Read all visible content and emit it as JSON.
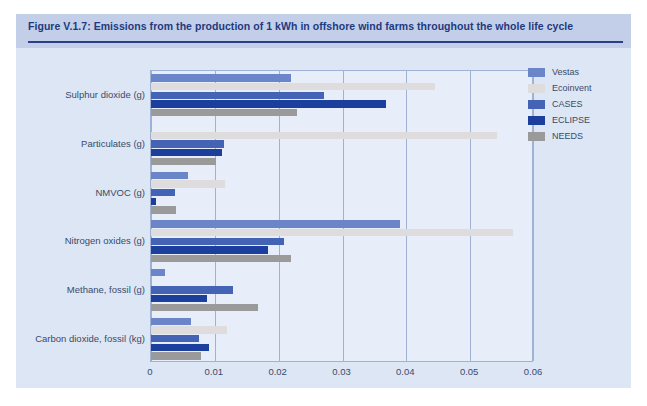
{
  "figure": {
    "title": "Figure V.1.7: Emissions from the production of 1 kWh in offshore wind farms throughout the whole life cycle",
    "title_band_color": "#c3cfe8",
    "title_text_color": "#22397f",
    "body_background": "#dde6f4",
    "plot_background": "#e7eef9",
    "grid_color": "#9fb2d4"
  },
  "chart_data": {
    "type": "bar",
    "orientation": "horizontal",
    "title": "Figure V.1.7: Emissions from the production of 1 kWh in offshore wind farms throughout the whole life cycle",
    "xlabel": "",
    "ylabel": "",
    "xlim": [
      0,
      0.06
    ],
    "xticks": [
      0,
      0.01,
      0.02,
      0.03,
      0.04,
      0.05,
      0.06
    ],
    "xtick_labels": [
      "0",
      "0.01",
      "0.02",
      "0.03",
      "0.04",
      "0.05",
      "0.06"
    ],
    "grid": true,
    "legend_position": "right",
    "categories": [
      "Sulphur dioxide (g)",
      "Particulates (g)",
      "NMVOC (g)",
      "Nitrogen oxides (g)",
      "Methane, fossil (g)",
      "Carbon dioxide, fossil (kg)"
    ],
    "series": [
      {
        "name": "Vestas",
        "color": "#6b86c8",
        "values": [
          0.022,
          0.0,
          0.0058,
          0.039,
          0.0022,
          0.0063
        ]
      },
      {
        "name": "Ecoinvent",
        "color": "#dedcdc",
        "values": [
          0.0445,
          0.0542,
          0.0116,
          0.0567,
          0.0,
          0.0119
        ]
      },
      {
        "name": "CASES",
        "color": "#4463b4",
        "values": [
          0.0271,
          0.0114,
          0.0038,
          0.0209,
          0.0128,
          0.0075
        ]
      },
      {
        "name": "ECLIPSE",
        "color": "#1c3f9e",
        "values": [
          0.0368,
          0.0112,
          0.0008,
          0.0183,
          0.0087,
          0.0091
        ]
      },
      {
        "name": "NEEDS",
        "color": "#9a9a9a",
        "values": [
          0.0228,
          0.0102,
          0.0039,
          0.022,
          0.0168,
          0.0078
        ]
      }
    ]
  }
}
